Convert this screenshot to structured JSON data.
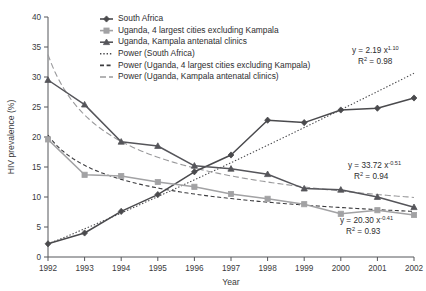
{
  "chart_data": {
    "type": "line",
    "title": "",
    "xlabel": "Year",
    "ylabel": "HIV prevalence (%)",
    "x": [
      1992,
      1993,
      1994,
      1995,
      1996,
      1997,
      1998,
      1999,
      2000,
      2001,
      2002
    ],
    "xtick_labels": [
      "1992",
      "1993",
      "1994",
      "1995",
      "1996",
      "1997",
      "1998",
      "1999",
      "2000",
      "2001",
      "2002"
    ],
    "ytick_labels": [
      "0",
      "5",
      "10",
      "15",
      "20",
      "25",
      "30",
      "35",
      "40"
    ],
    "ytick_values": [
      0,
      5,
      10,
      15,
      20,
      25,
      30,
      35,
      40
    ],
    "ylim": [
      0,
      40
    ],
    "xlim": [
      1992,
      2002
    ],
    "grid": false,
    "legend_position": "top-center",
    "series": [
      {
        "name": "South Africa",
        "marker": "diamond",
        "color": "#4a4a4d",
        "values": [
          2.2,
          4.0,
          7.6,
          10.4,
          14.2,
          17.0,
          22.8,
          22.4,
          24.5,
          24.8,
          26.5
        ]
      },
      {
        "name": "Uganda, 4 largest cities excluding Kampala",
        "marker": "square",
        "color": "#a2a2a4",
        "values": [
          19.6,
          13.7,
          13.5,
          12.5,
          11.7,
          10.5,
          9.7,
          8.8,
          7.2,
          7.8,
          7.0
        ]
      },
      {
        "name": "Uganda, Kampala antenatal clinics",
        "marker": "triangle",
        "color": "#55555a",
        "values": [
          29.5,
          25.4,
          19.2,
          18.5,
          15.2,
          14.7,
          13.8,
          11.4,
          11.2,
          10.0,
          8.3
        ]
      }
    ],
    "trendlines": [
      {
        "name": "Power (South Africa)",
        "style": "dotted",
        "color": "#4a4a4d",
        "equation": "y = 2.19 x",
        "exponent": "1.10",
        "r2_label": "R",
        "r2_value": "= 0.98",
        "coefficient": 2.19,
        "power": 1.1,
        "r2": 0.98
      },
      {
        "name": "Power (Uganda, 4 largest cities excluding Kampala)",
        "style": "dashed",
        "color": "#3c3c3f",
        "equation": "y = 20.30 x",
        "exponent": "-0.41",
        "r2_label": "R",
        "r2_value": "= 0.93",
        "coefficient": 20.3,
        "power": -0.41,
        "r2": 0.93
      },
      {
        "name": "Power (Uganda, Kampala antenatal clinics)",
        "style": "longdash",
        "color": "#9a9a9c",
        "equation": "y = 33.72 x",
        "exponent": "-0.51",
        "r2_label": "R",
        "r2_value": "= 0.94",
        "coefficient": 33.72,
        "power": -0.51,
        "r2": 0.94
      }
    ],
    "annotations": [
      {
        "id": "annot-south-africa",
        "line1_main": "y = 2.19 x",
        "line1_sup": "1.10",
        "line2_main": "R",
        "line2_sup": "2",
        "line2_rest": " = 0.98"
      },
      {
        "id": "annot-kampala",
        "line1_main": "y = 33.72 x",
        "line1_sup": "-0.51",
        "line2_main": "R",
        "line2_sup": "2",
        "line2_rest": " = 0.94"
      },
      {
        "id": "annot-four-cities",
        "line1_main": "y = 20.30 x",
        "line1_sup": "-0.41",
        "line2_main": "R",
        "line2_sup": "2",
        "line2_rest": " = 0.93"
      }
    ],
    "legend": [
      "South Africa",
      "Uganda, 4 largest cities excluding Kampala",
      "Uganda, Kampala antenatal clinics",
      "Power (South Africa)",
      "Power (Uganda, 4 largest cities excluding Kampala)",
      "Power (Uganda, Kampala antenatal clinics)"
    ]
  }
}
